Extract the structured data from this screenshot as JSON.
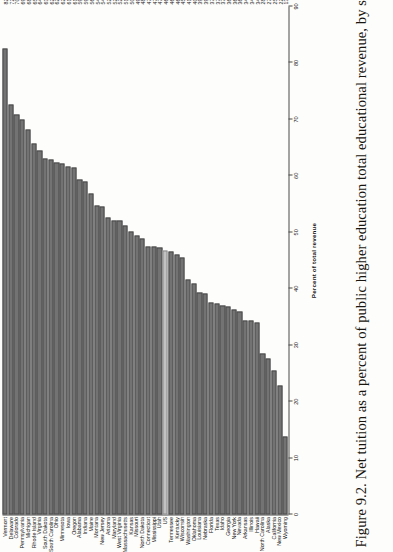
{
  "figure": {
    "caption": "Figure 9.2. Net tuition as a percent of public higher education total educational revenue, by state, 2012"
  },
  "chart_data": {
    "type": "bar",
    "orientation": "horizontal",
    "title": "Net tuition as a percent of public higher education total educational revenue, by state, 2012",
    "xlabel": "Percent of total revenue",
    "ylabel": "",
    "xlim": [
      0,
      90
    ],
    "xticks": [
      0,
      10,
      20,
      30,
      40,
      50,
      60,
      70,
      80,
      90
    ],
    "grid": false,
    "legend": "none",
    "highlight_category": "US",
    "highlight_color": "#c2c2c2",
    "bar_color": "#737373",
    "categories": [
      "Vermont",
      "Delaware",
      "Colorado",
      "Pennsylvania",
      "Michigan",
      "Rhode Island",
      "Virginia",
      "South Dakota",
      "South Carolina",
      "Ohio",
      "Minnesota",
      "Iowa",
      "Oregon",
      "Alabama",
      "Indiana",
      "Maine",
      "Montana",
      "New Jersey",
      "Arizona",
      "Maryland",
      "West Virginia",
      "Massachusetts",
      "Kansas",
      "Missouri",
      "North Dakota",
      "Connecticut",
      "Mississippi",
      "Utah",
      "US",
      "Tennessee",
      "Kentucky",
      "Wisconsin",
      "Washington",
      "Oklahoma",
      "Louisiana",
      "Nebraska",
      "Florida",
      "Texas",
      "Idaho",
      "Georgia",
      "New York",
      "Nevada",
      "Arkansas",
      "Illinois",
      "Hawaii",
      "North Carolina",
      "Alaska",
      "California",
      "New Mexico",
      "Wyoming"
    ],
    "values": [
      82.6,
      72.6,
      70.8,
      69.9,
      68.2,
      65.7,
      64.5,
      63.0,
      62.9,
      62.3,
      62.2,
      61.7,
      61.4,
      59.4,
      59.0,
      56.9,
      54.7,
      54.6,
      52.7,
      52.1,
      52.0,
      51.2,
      50.1,
      49.5,
      48.9,
      47.5,
      47.4,
      47.3,
      46.8,
      46.6,
      46.0,
      45.6,
      41.7,
      40.9,
      39.3,
      39.2,
      37.5,
      37.4,
      37.0,
      36.8,
      36.4,
      36.0,
      34.3,
      34.3,
      34.0,
      28.5,
      27.6,
      25.6,
      22.8,
      13.8
    ],
    "value_labels": [
      "82.6",
      "72.6",
      "70.8",
      "69.9",
      "68.2",
      "65.7",
      "64.5",
      "63.0",
      "62.9",
      "62.3",
      "62.2",
      "61.7",
      "61.4",
      "59.4",
      "59.0",
      "56.9",
      "54.7",
      "54.6",
      "52.7",
      "52.1",
      "52.0",
      "51.2",
      "50.1",
      "49.5",
      "48.9",
      "47.5",
      "47.4",
      "47.3",
      "46.8",
      "46.6",
      "46.0",
      "45.6",
      "41.7",
      "40.9",
      "39.3",
      "39.2",
      "37.5",
      "37.4",
      "37.0",
      "36.8",
      "36.4",
      "36.0",
      "34.3",
      "34.3",
      "34.0",
      "28.5",
      "27.6",
      "25.6",
      "22.8",
      "13.8"
    ]
  }
}
